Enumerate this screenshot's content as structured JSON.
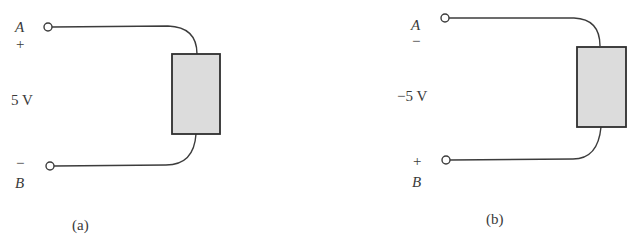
{
  "figure": {
    "type": "circuit-diagram",
    "panels": [
      {
        "id": "a",
        "caption": "(a)",
        "terminal_top": {
          "name": "A",
          "polarity": "+"
        },
        "terminal_bottom": {
          "name": "B",
          "polarity": "−"
        },
        "voltage_label": "5 V",
        "element": "generic two-terminal element (shaded box)"
      },
      {
        "id": "b",
        "caption": "(b)",
        "terminal_top": {
          "name": "A",
          "polarity": "−"
        },
        "terminal_bottom": {
          "name": "B",
          "polarity": "+"
        },
        "voltage_label": "−5 V",
        "element": "generic two-terminal element (shaded box)"
      }
    ],
    "colors": {
      "line": "#3c3c3c",
      "element_fill": "#dcdcdc",
      "text": "#3a3a3a",
      "background": "#ffffff"
    }
  }
}
